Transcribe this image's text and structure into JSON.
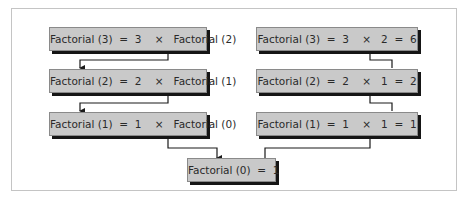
{
  "diagram": {
    "left_column": [
      {
        "label": "Factorial (3)  =  3    ×   Factorial (2)"
      },
      {
        "label": "Factorial (2)  =  2    ×   Factorial (1)"
      },
      {
        "label": "Factorial (1)  =  1    ×   Factorial (0)"
      }
    ],
    "base_case": {
      "label": "Factorial (0)  =  1"
    },
    "right_column": [
      {
        "label": "Factorial (3)  =  3    ×   2  =  6"
      },
      {
        "label": "Factorial (2)  =  2    ×   1  =  2"
      },
      {
        "label": "Factorial (1)  =  1    ×   1  =  1"
      }
    ],
    "colors": {
      "box_fill": "#c9c9c9",
      "box_shadow": "#151515",
      "line": "#1a1a1a",
      "frame": "#c4c4c4"
    }
  }
}
